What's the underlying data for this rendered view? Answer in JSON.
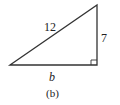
{
  "figure": {
    "caption": "(b)",
    "triangle": {
      "type": "right-triangle",
      "hypotenuse_label": "12",
      "vertical_leg_label": "7",
      "horizontal_leg_label": "b",
      "right_angle_marker": true,
      "stroke_color": "#333333"
    }
  }
}
